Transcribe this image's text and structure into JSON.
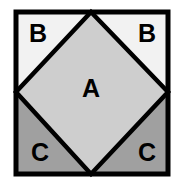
{
  "figure": {
    "type": "geometry-diagram",
    "background_color": "#ffffff",
    "outline_color": "#000000",
    "outline_width_px": 5,
    "canvas": {
      "width": 180,
      "height": 187
    },
    "outer_square": {
      "name": "outer-square",
      "left": 16,
      "top": 12,
      "right": 168,
      "bottom": 174
    },
    "inner_diamond": {
      "name": "inner-diamond",
      "vertices": [
        {
          "x": 91,
          "y": 12
        },
        {
          "x": 168,
          "y": 92
        },
        {
          "x": 91,
          "y": 174
        },
        {
          "x": 16,
          "y": 92
        }
      ]
    },
    "regions": [
      {
        "id": "region-a",
        "label": "A",
        "fill": "#cecece",
        "label_x": 91,
        "label_y": 88,
        "shape": "diamond"
      },
      {
        "id": "region-b-left",
        "label": "B",
        "fill": "#f2f2f2",
        "label_x": 38,
        "label_y": 33,
        "shape": "corner-triangle"
      },
      {
        "id": "region-b-right",
        "label": "B",
        "fill": "#f2f2f2",
        "label_x": 147,
        "label_y": 33,
        "shape": "corner-triangle"
      },
      {
        "id": "region-c-left",
        "label": "C",
        "fill": "#a0a0a0",
        "label_x": 40,
        "label_y": 152,
        "shape": "corner-triangle"
      },
      {
        "id": "region-c-right",
        "label": "C",
        "fill": "#a0a0a0",
        "label_x": 147,
        "label_y": 152,
        "shape": "corner-triangle"
      }
    ]
  }
}
